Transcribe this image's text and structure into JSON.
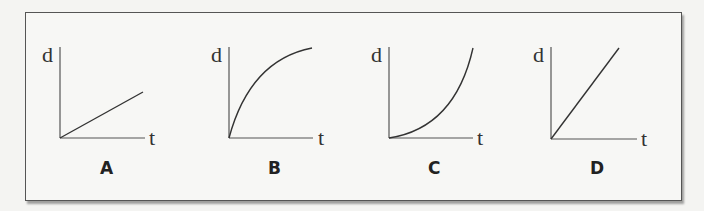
{
  "figure": {
    "graphs": [
      {
        "id": "A",
        "label": "A",
        "y_axis_label": "d",
        "x_axis_label": "t",
        "shape": "linear-shallow"
      },
      {
        "id": "B",
        "label": "B",
        "y_axis_label": "d",
        "x_axis_label": "t",
        "shape": "concave-down"
      },
      {
        "id": "C",
        "label": "C",
        "y_axis_label": "d",
        "x_axis_label": "t",
        "shape": "concave-up"
      },
      {
        "id": "D",
        "label": "D",
        "y_axis_label": "d",
        "x_axis_label": "t",
        "shape": "linear-steep"
      }
    ]
  },
  "colors": {
    "background": "#f4f4f2",
    "frame_border": "#555555",
    "curve": "#333333"
  }
}
